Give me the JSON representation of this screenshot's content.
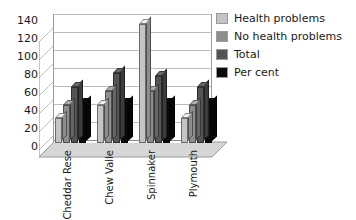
{
  "chart_data": {
    "type": "bar",
    "title": "",
    "subtitle": "",
    "xlabel": "",
    "ylabel": "",
    "ylim": [
      0,
      140
    ],
    "ytick_step": 20,
    "yticks": [
      140,
      120,
      100,
      80,
      60,
      40,
      20,
      0
    ],
    "grid": true,
    "grid_axis": "y",
    "style": "3d-clustered-column",
    "legend_position": "right",
    "categories": [
      "Cheddar Rese",
      "Chew Valle",
      "Spinnaker",
      "Plymouth"
    ],
    "series": [
      {
        "name": "Health problems",
        "color": "#c4c4c4",
        "values": [
          28,
          42,
          132,
          28
        ]
      },
      {
        "name": "No health problems",
        "color": "#8e8e8e",
        "values": [
          42,
          58,
          58,
          42
        ]
      },
      {
        "name": "Total",
        "color": "#545454",
        "values": [
          62,
          78,
          75,
          62
        ]
      },
      {
        "name": "Per cent",
        "color": "#0a0a0a",
        "values": [
          45,
          45,
          45,
          45
        ]
      }
    ]
  },
  "legend": {
    "items": [
      {
        "label": "Health problems",
        "color": "#c4c4c4"
      },
      {
        "label": "No health problems",
        "color": "#8e8e8e"
      },
      {
        "label": "Total",
        "color": "#545454"
      },
      {
        "label": "Per cent",
        "color": "#0a0a0a"
      }
    ]
  },
  "axes": {
    "y_labels": [
      "140",
      "120",
      "100",
      "80",
      "60",
      "40",
      "20",
      "0"
    ],
    "x_labels": [
      "Cheddar Rese",
      "Chew Valle",
      "Spinnaker",
      "Plymouth"
    ]
  },
  "colors": {
    "plot_background": "#ffffff",
    "gridline": "#bdbdbd",
    "axis_line": "#8a8a8a",
    "floor_fill": "#d6d6d6",
    "wall_fill": "#ffffff",
    "text": "#1a1a1a"
  }
}
